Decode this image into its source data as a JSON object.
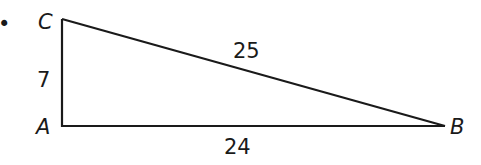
{
  "figure": {
    "type": "right-triangle",
    "bullet": "•",
    "vertices": {
      "C": "C",
      "A": "A",
      "B": "B"
    },
    "sides": {
      "CA": "7",
      "CB": "25",
      "AB": "24"
    },
    "colors": {
      "stroke": "#1a1a1a",
      "background": "#ffffff"
    }
  }
}
